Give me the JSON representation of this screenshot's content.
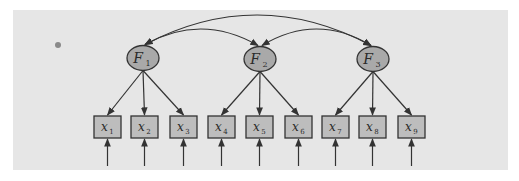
{
  "diagram": {
    "type": "confirmatory-factor-analysis-path-diagram",
    "colors": {
      "page_background": "#ffffff",
      "panel_background": "#e6e6e6",
      "factor_fill": "#a9a9a9",
      "indicator_fill": "#bdbdbd",
      "stroke": "#333333",
      "bullet": "#8a8a8a"
    },
    "factors": [
      {
        "id": "F1",
        "letter": "F",
        "sub": "1",
        "cx": 143,
        "cy": 58
      },
      {
        "id": "F2",
        "letter": "F",
        "sub": "2",
        "cx": 260,
        "cy": 59
      },
      {
        "id": "F3",
        "letter": "F",
        "sub": "3",
        "cx": 373,
        "cy": 59
      }
    ],
    "indicators": [
      {
        "id": "x1",
        "letter": "x",
        "sub": "1",
        "x": 94,
        "factor": "F1"
      },
      {
        "id": "x2",
        "letter": "x",
        "sub": "2",
        "x": 131,
        "factor": "F1"
      },
      {
        "id": "x3",
        "letter": "x",
        "sub": "3",
        "x": 170,
        "factor": "F1"
      },
      {
        "id": "x4",
        "letter": "x",
        "sub": "4",
        "x": 208,
        "factor": "F2"
      },
      {
        "id": "x5",
        "letter": "x",
        "sub": "5",
        "x": 246,
        "factor": "F2"
      },
      {
        "id": "x6",
        "letter": "x",
        "sub": "6",
        "x": 285,
        "factor": "F2"
      },
      {
        "id": "x7",
        "letter": "x",
        "sub": "7",
        "x": 322,
        "factor": "F3"
      },
      {
        "id": "x8",
        "letter": "x",
        "sub": "8",
        "x": 359,
        "factor": "F3"
      },
      {
        "id": "x9",
        "letter": "x",
        "sub": "9",
        "x": 398,
        "factor": "F3"
      }
    ],
    "covariances": [
      {
        "from": "F1",
        "to": "F2",
        "peak_y": 29
      },
      {
        "from": "F2",
        "to": "F3",
        "peak_y": 29
      },
      {
        "from": "F1",
        "to": "F3",
        "peak_y": 15
      }
    ],
    "error_terms": "one upward arrow into each indicator x1–x9"
  }
}
